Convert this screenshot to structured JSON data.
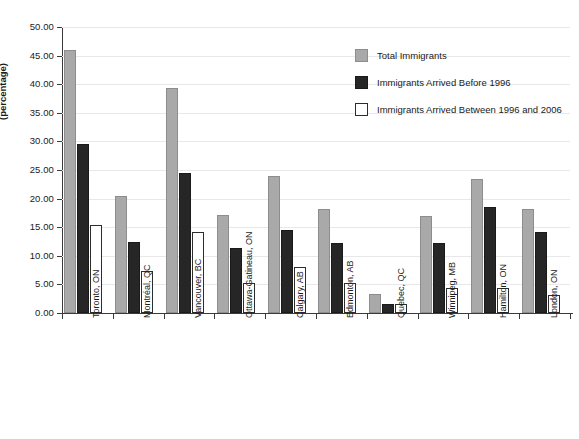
{
  "chart_data": {
    "type": "bar",
    "title": "",
    "xlabel": "",
    "ylabel": "(percentage)",
    "ylim": [
      0,
      50
    ],
    "ytick_step": 5,
    "ytick_labels": [
      "0.00",
      "5.00",
      "10.00",
      "15.00",
      "20.00",
      "25.00",
      "30.00",
      "35.00",
      "40.00",
      "45.00",
      "50.00"
    ],
    "grid": true,
    "legend_position": "top-right",
    "categories": [
      "Toronto, ON",
      "Montréal, QC",
      "Vancouver, BC",
      "Ottawa-Gatineau, ON",
      "Calgary, AB",
      "Edmonton, AB",
      "Quebec, QC",
      "Winnipeg, MB",
      "Hamilton, ON",
      "London, ON"
    ],
    "series": [
      {
        "name": "Total Immigrants",
        "color": "#a9a9a9",
        "values": [
          45.9,
          20.5,
          39.3,
          17.2,
          23.9,
          18.1,
          3.4,
          17.0,
          23.4,
          18.1
        ]
      },
      {
        "name": "Immigrants Arrived Before 1996",
        "color": "#262626",
        "values": [
          29.6,
          12.4,
          24.5,
          11.4,
          14.6,
          12.3,
          1.6,
          12.3,
          18.5,
          14.2
        ]
      },
      {
        "name": "Immigrants Arrived Between 1996 and 2006",
        "color": "#ffffff",
        "values": [
          15.4,
          7.3,
          14.2,
          5.2,
          8.0,
          5.3,
          1.6,
          4.3,
          4.3,
          3.2
        ]
      }
    ]
  },
  "legend": {
    "items": [
      {
        "label": "Total Immigrants",
        "swatch": "total"
      },
      {
        "label": "Immigrants Arrived Before 1996",
        "swatch": "before"
      },
      {
        "label": "Immigrants Arrived Between 1996 and 2006",
        "swatch": "between"
      }
    ]
  }
}
